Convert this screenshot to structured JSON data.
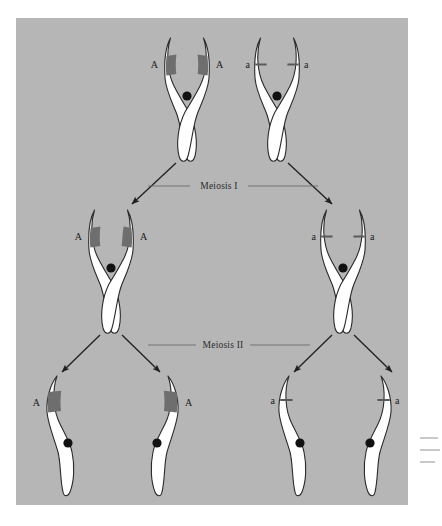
{
  "figure": {
    "panel_color": "#b6b6b6",
    "chromatid_fill": "#ffffff",
    "chromatid_stroke": "#2a2a2a",
    "band_color": "#6e6e6e",
    "centromere_color": "#111111",
    "arrow_color": "#1f1f1f",
    "divider_color": "#6b6b6b"
  },
  "stages": [
    {
      "id": "meiosis-1",
      "label": "Meiosis I"
    },
    {
      "id": "meiosis-2",
      "label": "Meiosis II"
    }
  ],
  "alleles": {
    "dominant": "A",
    "recessive": "a"
  },
  "rows": [
    {
      "id": "parent-row",
      "name": "homologous-pair",
      "cells": [
        {
          "id": "parent-A",
          "allele": "A",
          "marker": "band",
          "labels": [
            "A",
            "A"
          ],
          "shape": "x-shaped-replicated"
        },
        {
          "id": "parent-a",
          "allele": "a",
          "marker": "line",
          "labels": [
            "a",
            "a"
          ],
          "shape": "x-shaped-replicated"
        }
      ]
    },
    {
      "id": "meiosis1-products",
      "name": "secondary-cells",
      "cells": [
        {
          "id": "daughter-A",
          "allele": "A",
          "marker": "band",
          "labels": [
            "A",
            "A"
          ],
          "shape": "x-shaped-replicated"
        },
        {
          "id": "daughter-a",
          "allele": "a",
          "marker": "line",
          "labels": [
            "a",
            "a"
          ],
          "shape": "x-shaped-replicated"
        }
      ]
    },
    {
      "id": "meiosis2-products",
      "name": "gametes",
      "cells": [
        {
          "id": "gamete-1",
          "allele": "A",
          "marker": "band",
          "labels": [
            "A"
          ],
          "label_side": "left",
          "shape": "single-chromatid"
        },
        {
          "id": "gamete-2",
          "allele": "A",
          "marker": "band",
          "labels": [
            "A"
          ],
          "label_side": "right",
          "shape": "single-chromatid"
        },
        {
          "id": "gamete-3",
          "allele": "a",
          "marker": "line",
          "labels": [
            "a"
          ],
          "label_side": "left",
          "shape": "single-chromatid"
        },
        {
          "id": "gamete-4",
          "allele": "a",
          "marker": "line",
          "labels": [
            "a"
          ],
          "label_side": "right",
          "shape": "single-chromatid"
        }
      ]
    }
  ]
}
